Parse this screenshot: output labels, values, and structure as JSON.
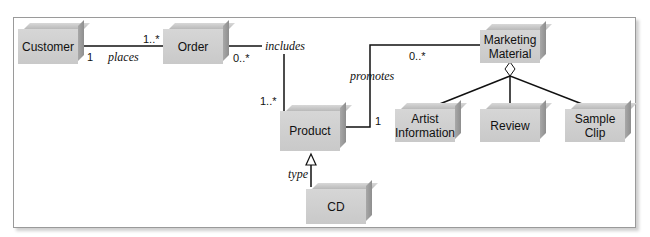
{
  "diagram": {
    "classes": {
      "customer": "Customer",
      "order": "Order",
      "product": "Product",
      "cd": "CD",
      "marketing_material": "Marketing Material",
      "artist_information": "Artist Information",
      "review": "Review",
      "sample_clip": "Sample Clip"
    },
    "associations": {
      "places": {
        "label": "places",
        "customer_mult": "1",
        "order_mult": "1..*"
      },
      "includes": {
        "label": "includes",
        "order_mult": "0..*",
        "product_mult": "1..*"
      },
      "promotes": {
        "label": "promotes",
        "product_mult": "1",
        "marketing_mult": "0..*"
      },
      "type": {
        "label": "type"
      }
    }
  }
}
